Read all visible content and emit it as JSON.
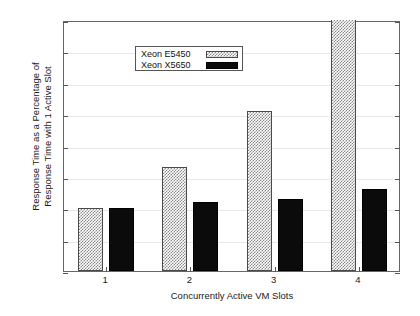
{
  "chart_data": {
    "type": "bar",
    "title": "",
    "xlabel": "Concurrently Active VM Slots",
    "ylabel_line1": "Response Time as a Percentage of",
    "ylabel_line2": "Response Time with 1 Active Slot",
    "categories": [
      "1",
      "2",
      "3",
      "4"
    ],
    "ylim": [
      80,
      160
    ],
    "ytick_labels": [
      "160 %",
      "150 %",
      "140 %",
      "130 %",
      "120 %",
      "110 %",
      "100 %",
      "90 %",
      "80 %"
    ],
    "ytick_values": [
      160,
      150,
      140,
      130,
      120,
      110,
      100,
      90,
      80
    ],
    "grid": true,
    "legend_position": "top-left",
    "series": [
      {
        "name": "Xeon E5450",
        "pattern": "checkerboard-hatch",
        "color": "#8a8a8a",
        "values": [
          100,
          113,
          131,
          160
        ],
        "clipped": [
          false,
          false,
          false,
          true
        ]
      },
      {
        "name": "Xeon X5650",
        "pattern": "solid",
        "color": "#0b0b0b",
        "values": [
          100,
          102,
          103,
          106
        ],
        "clipped": [
          false,
          false,
          false,
          false
        ]
      }
    ]
  },
  "legend": {
    "items": [
      {
        "label": "Xeon E5450"
      },
      {
        "label": "Xeon X5650"
      }
    ]
  }
}
